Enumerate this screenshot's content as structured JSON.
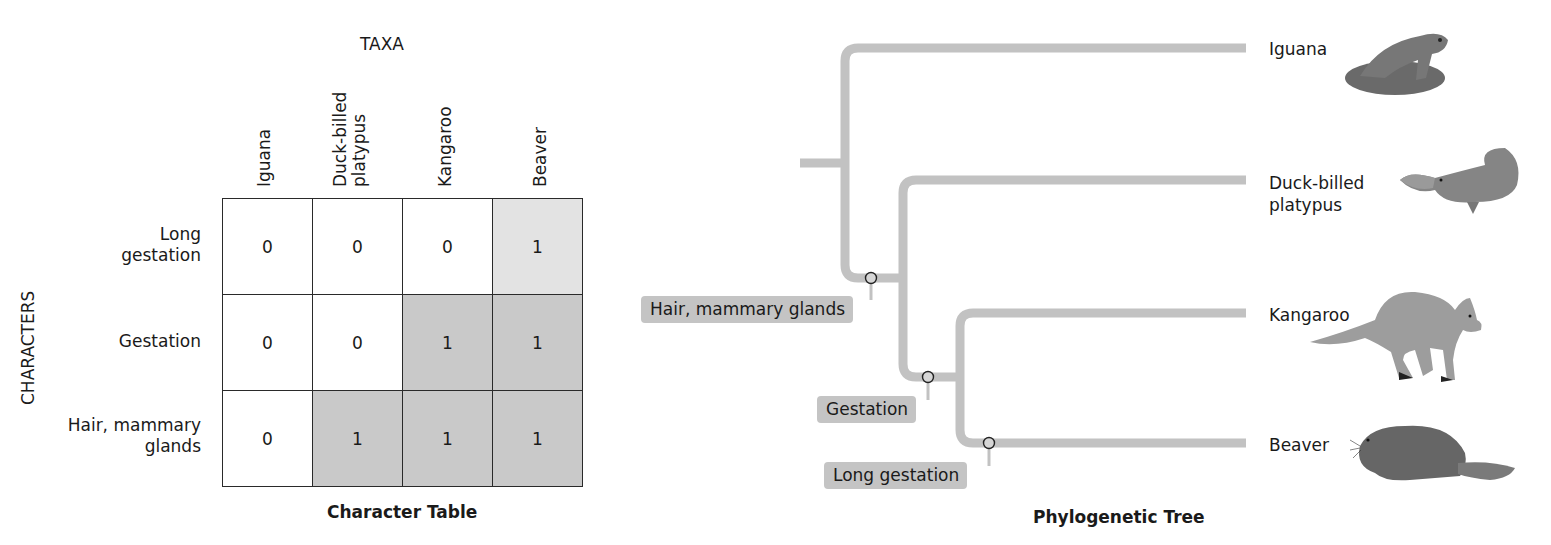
{
  "character_table": {
    "taxa_heading": "TAXA",
    "characters_heading": "CHARACTERS",
    "caption": "Character Table",
    "columns": [
      "Iguana",
      "Duck-billed\nplatypus",
      "Kangaroo",
      "Beaver"
    ],
    "rows": [
      {
        "label": "Long\ngestation",
        "values": [
          "0",
          "0",
          "0",
          "1"
        ]
      },
      {
        "label": "Gestation",
        "values": [
          "0",
          "0",
          "1",
          "1"
        ]
      },
      {
        "label": "Hair, mammary\nglands",
        "values": [
          "0",
          "1",
          "1",
          "1"
        ]
      }
    ]
  },
  "phylogenetic_tree": {
    "caption": "Phylogenetic Tree",
    "leaves": [
      {
        "label": "Iguana",
        "image": "iguana-illustration"
      },
      {
        "label": "Duck-billed\nplatypus",
        "image": "platypus-illustration"
      },
      {
        "label": "Kangaroo",
        "image": "kangaroo-illustration"
      },
      {
        "label": "Beaver",
        "image": "beaver-illustration"
      }
    ],
    "derived_characters": [
      "Hair, mammary glands",
      "Gestation",
      "Long gestation"
    ]
  },
  "colors": {
    "branch": "#c2c2c2",
    "cell_shaded": "#c9c9c9",
    "cell_light": "#e3e3e3",
    "tag_bg": "#c4c4c4"
  }
}
